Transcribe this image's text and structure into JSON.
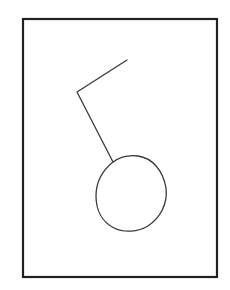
{
  "diagram": {
    "background": "#ffffff",
    "frame": {
      "x": 23,
      "y": 19,
      "width": 194,
      "height": 258,
      "stroke": "#222222",
      "stroke_width": 2.2
    },
    "stem": {
      "points": [
        [
          127,
          60
        ],
        [
          77,
          92
        ],
        [
          113,
          162
        ]
      ],
      "stroke": "#3a3a3a",
      "stroke_width": 1.3
    },
    "circle": {
      "center": [
        131,
        193
      ],
      "approx_radius_x": 35,
      "approx_radius_y": 37,
      "stroke": "#3a3a3a",
      "stroke_width": 1.3,
      "fill": "none"
    }
  }
}
